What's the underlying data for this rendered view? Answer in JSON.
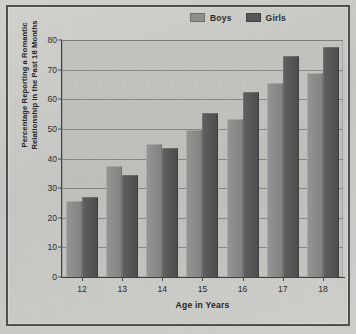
{
  "chart_data": {
    "type": "bar",
    "title": "",
    "xlabel": "Age in Years",
    "ylabel": "Percentage Reporting a Romantic Relationship in the Past 18 Months",
    "ylabel_lines": [
      "Percentage Reporting a Romantic",
      "Relationship in the Past 18 Months"
    ],
    "categories": [
      "12",
      "13",
      "14",
      "15",
      "16",
      "17",
      "18"
    ],
    "series": [
      {
        "name": "Boys",
        "color": "#8b8b89",
        "values": [
          25.5,
          37.5,
          45.0,
          49.5,
          53.5,
          65.5,
          69.0
        ]
      },
      {
        "name": "Girls",
        "color": "#555555",
        "values": [
          27.0,
          34.5,
          43.5,
          55.5,
          62.5,
          74.5,
          77.5
        ]
      }
    ],
    "ylim": [
      0,
      80
    ],
    "ytick_values": [
      0,
      10,
      20,
      30,
      40,
      50,
      60,
      70,
      80
    ],
    "ytick_labels": [
      "0",
      "10",
      "20",
      "30",
      "40",
      "50",
      "60",
      "70",
      "80"
    ],
    "grid": true,
    "grid_axis": "y",
    "legend_position": "top-right"
  },
  "legend": {
    "items": [
      {
        "label": "Boys",
        "swatch": "boys-swatch"
      },
      {
        "label": "Girls",
        "swatch": "girls-swatch"
      }
    ]
  },
  "colors": {
    "page_background": "#c9c9c7",
    "plot_background": "#c1c1be",
    "frame": "#4e4e4e",
    "axis": "#3f3f3f",
    "gridline": "#5a5a5a",
    "boys": "#8b8b89",
    "girls": "#555555",
    "text": "#2b2b2b"
  }
}
